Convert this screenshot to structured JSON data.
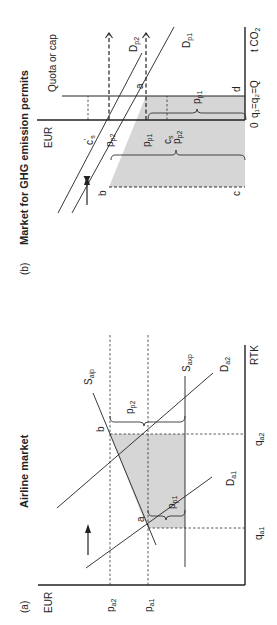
{
  "figure": {
    "rotation_deg": -90,
    "panel_b": {
      "tag": "(b)",
      "title": "Market for GHG emission permits",
      "y_axis_label": "EUR",
      "x_axis_label": "t CO",
      "x_axis_label_sub": "2",
      "origin_label": "0",
      "quota_label": "Quota or cap",
      "quantity_label": "q₁=q₂=Q",
      "y_ticks": [
        {
          "main": "c",
          "sup": "'",
          "sub": "s"
        },
        {
          "main": "p",
          "sub": "p2"
        },
        {
          "main": "p",
          "sub": "p1"
        },
        {
          "main": "c",
          "sub": "s"
        }
      ],
      "curves": [
        {
          "main": "D",
          "sub": "p2"
        },
        {
          "main": "D",
          "sub": "p1"
        }
      ],
      "points": [
        "a",
        "b",
        "c",
        "d"
      ],
      "braces": [
        {
          "main": "p",
          "sub": "p2"
        },
        {
          "main": "p",
          "sub": "p1"
        }
      ],
      "shift_arrow": "arrow-up-icon"
    },
    "panel_a": {
      "tag": "(a)",
      "title": "Airline market",
      "y_axis_label": "EUR",
      "x_axis_label": "RTK",
      "y_ticks": [
        {
          "main": "p",
          "sub": "a2"
        },
        {
          "main": "p",
          "sub": "a1"
        }
      ],
      "x_ticks": [
        {
          "main": "q",
          "sub": "a1"
        },
        {
          "main": "q",
          "sub": "a2"
        }
      ],
      "curves": [
        {
          "main": "S",
          "sub": "aip"
        },
        {
          "main": "S",
          "sub": "axp"
        },
        {
          "main": "D",
          "sub": "a2"
        },
        {
          "main": "D",
          "sub": "a1"
        }
      ],
      "points": [
        "a",
        "b"
      ],
      "braces": [
        {
          "main": "p",
          "sub": "p2"
        },
        {
          "main": "p",
          "sub": "p1"
        }
      ],
      "shift_arrow": "arrow-up-icon"
    }
  }
}
